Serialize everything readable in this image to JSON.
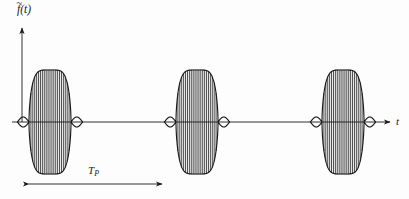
{
  "figure": {
    "type": "waveform-diagram",
    "background_color": "#fdfdfd",
    "ink_color": "#1a1a1a"
  },
  "axes": {
    "vertical": {
      "label_base": "f",
      "label_arg": "(t)",
      "label_accent": "~",
      "label_full": "f̃(t)",
      "origin_x": 22,
      "top_y": 26,
      "bottom_y": 122,
      "arrowhead": "up"
    },
    "horizontal": {
      "label": "t",
      "axis_y": 122,
      "start_x": 12,
      "end_x": 392,
      "arrowhead": "right"
    }
  },
  "annotation": {
    "period_marker": {
      "label_base": "T",
      "label_sub": "P",
      "label_full": "T_P",
      "arrow_y": 184,
      "start_x": 23,
      "end_x": 168,
      "arrowheads": "both"
    }
  },
  "chart_data": {
    "type": "line",
    "title": "",
    "xlabel": "t",
    "ylabel": "f̃(t)",
    "baseline_y": 122,
    "envelope": {
      "peak_amplitude": 52,
      "sidelobe_amplitude": 5,
      "half_width": 21,
      "shape": "raised-cosine pulse with small negative side lobes"
    },
    "carrier": {
      "oscillation_count_per_burst": 11,
      "description": "dense sinusoidal carrier filling each envelope"
    },
    "bursts": [
      {
        "index": 1,
        "center_x": 50
      },
      {
        "index": 2,
        "center_x": 197
      },
      {
        "index": 3,
        "center_x": 343
      }
    ],
    "period_px": 146,
    "grid": false,
    "legend": false
  }
}
